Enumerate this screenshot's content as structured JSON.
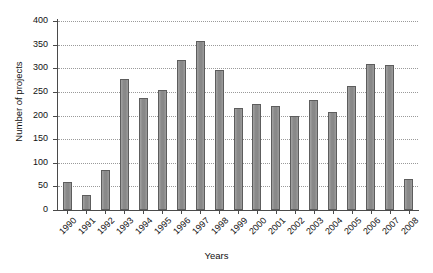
{
  "chart_data": {
    "type": "bar",
    "title": "",
    "xlabel": "Years",
    "ylabel": "Number of projects",
    "categories": [
      "1990",
      "1991",
      "1992",
      "1993",
      "1994",
      "1995",
      "1996",
      "1997",
      "1998",
      "1999",
      "2000",
      "2001",
      "2002",
      "2003",
      "2004",
      "2005",
      "2006",
      "2007",
      "2008"
    ],
    "values": [
      59,
      31,
      85,
      277,
      238,
      255,
      318,
      357,
      296,
      215,
      224,
      221,
      199,
      233,
      208,
      262,
      310,
      307,
      65
    ],
    "ylim": [
      0,
      400
    ],
    "yticks": [
      0,
      50,
      100,
      150,
      200,
      250,
      300,
      350,
      400
    ],
    "ytick_labels": [
      "0",
      "50",
      "100",
      "150",
      "200",
      "250",
      "300",
      "350",
      "400"
    ],
    "grid": true,
    "grid_axis": "y",
    "grid_style": "dotted",
    "legend": false,
    "bar_color": "#8e8e8e",
    "bar_edge_color": "#5d5d5d",
    "axis_color": "#4a4a4a",
    "background_color": "#ffffff",
    "xtick_rotation": -45
  }
}
